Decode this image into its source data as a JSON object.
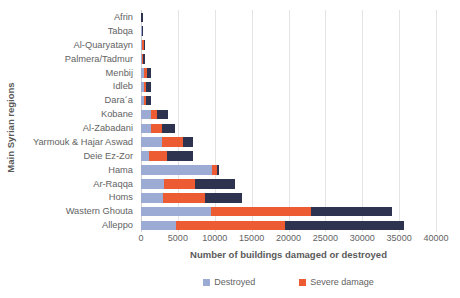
{
  "chart_data": {
    "type": "bar",
    "orientation": "horizontal",
    "stacked": true,
    "title": "",
    "xlabel": "Number of buildings damaged or destroyed",
    "ylabel": "Main Syrian regions",
    "xlim": [
      0,
      40000
    ],
    "xticks": [
      0,
      5000,
      10000,
      15000,
      20000,
      25000,
      30000,
      35000,
      40000
    ],
    "xtick_labels": [
      "0",
      "5000",
      "10000",
      "15000",
      "20000",
      "25000",
      "30000",
      "35000",
      "40000"
    ],
    "grid": "vertical",
    "legend_position": "bottom",
    "categories": [
      "Afrin",
      "Tabqa",
      "Al-Quaryatayn",
      "Palmera/Tadmur",
      "Menbij",
      "Idleb",
      "Dara´a",
      "Kobane",
      "Al-Zabadani",
      "Yarmouk & Hajar Aswad",
      "Deie Ez-Zor",
      "Hama",
      "Ar-Raqqa",
      "Homs",
      "Wastern Ghouta",
      "Alleppo"
    ],
    "series": [
      {
        "name": "Destroyed",
        "color": "#9BABD4",
        "values": [
          60,
          100,
          130,
          150,
          420,
          380,
          430,
          1300,
          1300,
          2900,
          1100,
          9600,
          3100,
          3000,
          9500,
          4700
        ]
      },
      {
        "name": "Severe damage",
        "color": "#ED5B33",
        "values": [
          0,
          60,
          210,
          110,
          330,
          330,
          300,
          900,
          1500,
          2800,
          2400,
          700,
          4200,
          5700,
          13500,
          14800
        ]
      },
      {
        "name": "",
        "color": "#2E3450",
        "values": [
          40,
          160,
          60,
          300,
          550,
          620,
          560,
          1400,
          1800,
          1300,
          3500,
          300,
          5400,
          5000,
          11000,
          16200
        ]
      }
    ],
    "totals": [
      100,
      320,
      400,
      560,
      1300,
      1330,
      1290,
      3600,
      4600,
      7000,
      7000,
      10600,
      12700,
      13700,
      34000,
      35700
    ]
  },
  "legend": {
    "items": [
      {
        "label": "Destroyed",
        "color": "#9BABD4"
      },
      {
        "label": "Severe damage",
        "color": "#ED5B33"
      }
    ]
  },
  "axes": {
    "x_title": "Number of buildings damaged or destroyed",
    "y_title": "Main Syrian regions"
  }
}
